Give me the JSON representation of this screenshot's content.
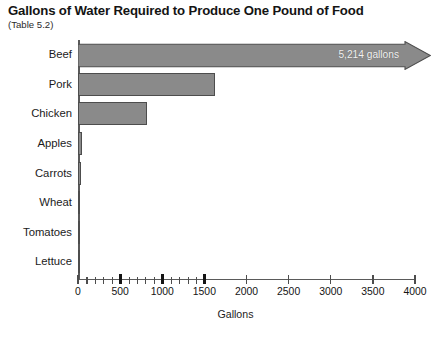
{
  "header": {
    "title": "Gallons of Water Required to Produce One Pound of Food",
    "subtitle": "(Table 5.2)"
  },
  "chart_data": {
    "type": "bar",
    "orientation": "horizontal",
    "title": "Gallons of Water Required to Produce One Pound of Food",
    "subtitle": "(Table 5.2)",
    "xlabel": "Gallons",
    "ylabel": "",
    "xlim": [
      0,
      4000
    ],
    "grid": false,
    "legend": false,
    "categories": [
      "Beef",
      "Pork",
      "Chicken",
      "Apples",
      "Carrots",
      "Wheat",
      "Tomatoes",
      "Lettuce"
    ],
    "values": [
      5214,
      1630,
      815,
      49,
      33,
      25,
      23,
      23
    ],
    "annotations": [
      {
        "category": "Beef",
        "text": "5,214 gallons",
        "note": "bar drawn as arrow extending past axis maximum (off-scale value)"
      }
    ],
    "xticks": [
      0,
      500,
      1000,
      1500,
      2000,
      2500,
      3000,
      3500,
      4000
    ],
    "xtick_labels": [
      "0",
      "500",
      "1000",
      "1500",
      "2000",
      "2500",
      "3000",
      "3500",
      "4000"
    ],
    "xticks_bold": [
      500,
      1000,
      1500
    ],
    "xminor_ticks": [
      100,
      200,
      300,
      400,
      600,
      700,
      800,
      900,
      1100,
      1200,
      1300,
      1400
    ],
    "colors": {
      "bar_fill": "#8a8a8a",
      "bar_border": "#4d4d4d",
      "axis": "#5a5a5a",
      "text": "#141414",
      "label_on_bar": "#f2f2f2"
    }
  },
  "bars": [
    {
      "label": "Beef",
      "value": 5214,
      "value_label": "5,214 gallons"
    },
    {
      "label": "Pork",
      "value": 1630,
      "value_label": ""
    },
    {
      "label": "Chicken",
      "value": 815,
      "value_label": ""
    },
    {
      "label": "Apples",
      "value": 49,
      "value_label": ""
    },
    {
      "label": "Carrots",
      "value": 33,
      "value_label": ""
    },
    {
      "label": "Wheat",
      "value": 25,
      "value_label": ""
    },
    {
      "label": "Tomatoes",
      "value": 23,
      "value_label": ""
    },
    {
      "label": "Lettuce",
      "value": 23,
      "value_label": ""
    }
  ],
  "axis": {
    "title": "Gallons",
    "ticks": [
      {
        "label": "0",
        "value": 0,
        "bold": false
      },
      {
        "label": "500",
        "value": 500,
        "bold": true
      },
      {
        "label": "1000",
        "value": 1000,
        "bold": true
      },
      {
        "label": "1500",
        "value": 1500,
        "bold": true
      },
      {
        "label": "2000",
        "value": 2000,
        "bold": false
      },
      {
        "label": "2500",
        "value": 2500,
        "bold": false
      },
      {
        "label": "3000",
        "value": 3000,
        "bold": false
      },
      {
        "label": "3500",
        "value": 3500,
        "bold": false
      },
      {
        "label": "4000",
        "value": 4000,
        "bold": false
      }
    ],
    "minor_ticks": [
      100,
      200,
      300,
      400,
      600,
      700,
      800,
      900,
      1100,
      1200,
      1300,
      1400
    ]
  }
}
